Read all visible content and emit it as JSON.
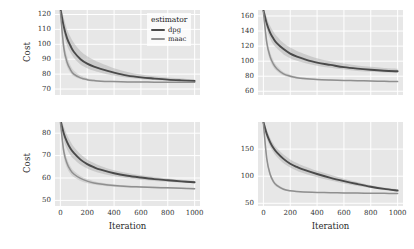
{
  "chart_data": {
    "type": "line",
    "title": "",
    "layout": {
      "rows": 2,
      "cols": 2,
      "grid": true,
      "style": "seaborn-darkgrid",
      "legend_position": "top-right of panel 1",
      "shaded_band": "95% confidence interval"
    },
    "xlabel": "Iteration",
    "ylabel": "Cost",
    "xlim": [
      -40,
      1040
    ],
    "xticks": [
      0,
      200,
      400,
      600,
      800,
      1000
    ],
    "legend": {
      "title": "estimator",
      "entries": [
        {
          "label": "dpg",
          "color": "#4a4a4a"
        },
        {
          "label": "maac",
          "color": "#8f8f8f"
        }
      ]
    },
    "panels": [
      {
        "id": "top-left",
        "ylim": [
          66,
          123
        ],
        "yticks": [
          70,
          80,
          90,
          100,
          110,
          120
        ],
        "show_ylabel": true,
        "show_xlabel": false,
        "show_xticks": false,
        "show_legend": true,
        "x": [
          0,
          25,
          50,
          75,
          100,
          150,
          200,
          250,
          300,
          400,
          500,
          600,
          700,
          800,
          900,
          1000
        ],
        "series": [
          {
            "name": "dpg",
            "values": [
              124,
              112,
              104,
              99,
              95,
              90,
              87,
              85,
              83.5,
              81,
              79,
              77.8,
              77,
              76.3,
              75.8,
              75.4
            ],
            "band_lo": [
              121,
              107,
              99,
              94.5,
              91,
              86.5,
              84,
              82.2,
              81,
              79,
              77.6,
              76.6,
              76,
              75.5,
              75.1,
              74.8
            ],
            "band_hi": [
              127,
              118,
              110,
              105,
              101,
              95.5,
              92,
              89.5,
              87.5,
              84,
              81.5,
              79.8,
              78.6,
              77.7,
              77,
              76.4
            ]
          },
          {
            "name": "maac",
            "values": [
              122,
              98,
              88,
              83,
              80,
              77.5,
              76.3,
              75.7,
              75.3,
              75,
              74.8,
              74.7,
              74.6,
              74.6,
              74.5,
              74.5
            ],
            "band_lo": [
              118,
              94,
              85,
              81,
              78.5,
              76.5,
              75.6,
              75.1,
              74.9,
              74.6,
              74.5,
              74.4,
              74.3,
              74.3,
              74.3,
              74.2
            ],
            "band_hi": [
              126,
              103,
              92,
              86,
              82.5,
              79,
              77.3,
              76.4,
              75.9,
              75.4,
              75.1,
              75.0,
              74.9,
              74.9,
              74.8,
              74.8
            ]
          }
        ]
      },
      {
        "id": "top-right",
        "ylim": [
          55,
          168
        ],
        "yticks": [
          60,
          80,
          100,
          120,
          140,
          160
        ],
        "show_ylabel": false,
        "show_xlabel": false,
        "show_xticks": false,
        "show_legend": false,
        "x": [
          0,
          25,
          50,
          75,
          100,
          150,
          200,
          250,
          300,
          400,
          500,
          600,
          700,
          800,
          900,
          1000
        ],
        "series": [
          {
            "name": "dpg",
            "values": [
              168,
              150,
              138,
              130,
              124,
              116,
              110,
              106,
              103,
              98,
              95,
              92,
              90,
              88.5,
              87.3,
              86.5
            ],
            "band_lo": [
              163,
              143,
              130,
              122,
              117,
              109,
              104,
              100.5,
              98,
              94,
              91.2,
              88.8,
              87,
              85.8,
              85,
              84.3
            ],
            "band_hi": [
              173,
              158,
              147,
              139,
              133,
              124,
              118,
              113.5,
              110,
              104,
              100,
              96.8,
              94.3,
              92.4,
              91,
              90
            ]
          }
        ],
        "series_extra": [
          {
            "name": "maac",
            "values": [
              166,
              125,
              106,
              96,
              90,
              83,
              80,
              78,
              76.8,
              75.5,
              74.8,
              74.3,
              74,
              73.6,
              73.2,
              72.8
            ],
            "band_lo": [
              160,
              119,
              101,
              92,
              87,
              80.8,
              78.2,
              76.6,
              75.6,
              74.6,
              74,
              73.6,
              73.3,
              73,
              72.6,
              72.3
            ],
            "band_hi": [
              172,
              132,
              112,
              101,
              94,
              85.5,
              82,
              79.6,
              78.2,
              76.6,
              75.7,
              75.1,
              74.7,
              74.3,
              73.9,
              73.5
            ]
          }
        ]
      },
      {
        "id": "bottom-left",
        "ylim": [
          47.5,
          85
        ],
        "yticks": [
          50,
          60,
          70,
          80
        ],
        "show_ylabel": true,
        "show_xlabel": true,
        "show_xticks": true,
        "show_legend": false,
        "x": [
          0,
          25,
          50,
          75,
          100,
          150,
          200,
          250,
          300,
          400,
          500,
          600,
          700,
          800,
          900,
          1000
        ],
        "series": [
          {
            "name": "dpg",
            "values": [
              86,
              80,
              76,
              73.2,
              71.2,
              68.2,
              66.2,
              64.8,
              63.7,
              62.1,
              61,
              60.2,
              59.5,
              59,
              58.5,
              58.1
            ],
            "band_lo": [
              84,
              77,
              72.8,
              70.2,
              68.5,
              65.9,
              64.2,
              63,
              62.1,
              60.8,
              59.9,
              59.2,
              58.7,
              58.3,
              57.9,
              57.6
            ],
            "band_hi": [
              88,
              83,
              79.2,
              76.3,
              74,
              70.6,
              68.3,
              66.7,
              65.4,
              63.5,
              62.2,
              61.2,
              60.4,
              59.8,
              59.2,
              58.7
            ]
          }
        ],
        "series_extra": [
          {
            "name": "maac",
            "values": [
              85,
              72,
              66.5,
              63.5,
              61.8,
              59.8,
              58.6,
              57.8,
              57.3,
              56.6,
              56.2,
              56,
              55.8,
              55.6,
              55.4,
              55.2
            ],
            "band_lo": [
              83,
              69.6,
              64.5,
              61.9,
              60.4,
              58.7,
              57.7,
              57.1,
              56.7,
              56.1,
              55.8,
              55.6,
              55.4,
              55.2,
              55.1,
              54.9
            ],
            "band_hi": [
              87,
              74.5,
              68.6,
              65.2,
              63.2,
              60.9,
              59.5,
              58.6,
              58,
              57.1,
              56.7,
              56.4,
              56.2,
              56,
              55.8,
              55.6
            ]
          }
        ]
      },
      {
        "id": "bottom-right",
        "ylim": [
          45,
          200
        ],
        "yticks": [
          50,
          100,
          150
        ],
        "show_ylabel": false,
        "show_xlabel": true,
        "show_xticks": true,
        "show_legend": false,
        "x": [
          0,
          25,
          50,
          75,
          100,
          150,
          200,
          250,
          300,
          400,
          500,
          600,
          700,
          800,
          900,
          1000
        ],
        "series": [
          {
            "name": "dpg",
            "values": [
              200,
              178,
              163,
              152,
              144,
              132,
              123,
              117,
              112,
              104,
              97,
              91,
              85.5,
              80.5,
              76.5,
              73.5
            ],
            "band_lo": [
              194,
              170,
              155,
              144,
              136,
              124,
              116,
              110,
              105.5,
              98,
              92,
              86.5,
              82,
              78,
              74.5,
              72
            ],
            "band_hi": [
              206,
              186,
              171,
              160,
              152,
              140,
              131,
              124.5,
              119,
              110,
              102.5,
              95.5,
              89.5,
              83.5,
              79,
              75.5
            ]
          }
        ],
        "series_extra": [
          {
            "name": "maac",
            "values": [
              198,
              133,
              104,
              90,
              83,
              76,
              73,
              71.6,
              70.8,
              70,
              69.5,
              69.2,
              68.9,
              68.6,
              68.3,
              68
            ],
            "band_lo": [
              191,
              127,
              99.5,
              86.5,
              80.2,
              74.2,
              71.7,
              70.6,
              69.9,
              69.3,
              68.9,
              68.6,
              68.4,
              68.1,
              67.9,
              67.6
            ],
            "band_hi": [
              205,
              140,
              109,
              94,
              86,
              78,
              74.5,
              72.8,
              71.8,
              70.8,
              70.2,
              69.8,
              69.5,
              69.2,
              68.8,
              68.5
            ]
          }
        ]
      }
    ]
  },
  "colors": {
    "panel_bg": "#e7e7e7",
    "grid": "#ffffff",
    "dpg": "#4a4a4a",
    "maac": "#8f8f8f",
    "band": "#b5b5b5",
    "tick_text": "#333333"
  }
}
